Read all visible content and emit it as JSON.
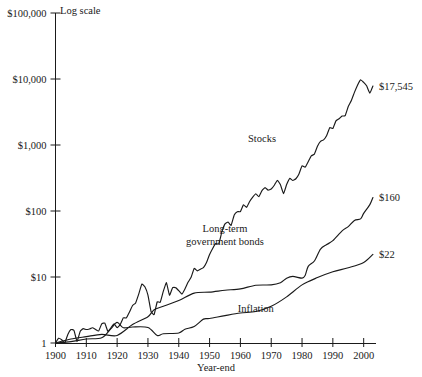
{
  "chart_data": {
    "type": "line",
    "title": "",
    "subtitle": "",
    "note": "Log scale",
    "xlabel": "Year-end",
    "ylabel": "",
    "log_y": true,
    "grid": false,
    "legend": "inline-annotations",
    "xlim": [
      1900,
      2004
    ],
    "ylim": [
      1,
      100000
    ],
    "x_ticks": [
      "1900",
      "1910",
      "1920",
      "1930",
      "1940",
      "1950",
      "1960",
      "1970",
      "1980",
      "1990",
      "2000"
    ],
    "y_ticks": [
      "$100,000",
      "$10,000",
      "$1,000",
      "$100",
      "$10",
      "1"
    ],
    "y_tick_values": [
      100000,
      10000,
      1000,
      100,
      10,
      1
    ],
    "series": [
      {
        "name": "Stocks",
        "end_label": "$17,545",
        "end_value": 17545,
        "x": [
          1900,
          1901,
          1902,
          1903,
          1904,
          1905,
          1906,
          1907,
          1908,
          1909,
          1910,
          1911,
          1912,
          1913,
          1914,
          1915,
          1916,
          1917,
          1918,
          1919,
          1920,
          1921,
          1922,
          1923,
          1924,
          1925,
          1926,
          1927,
          1928,
          1929,
          1930,
          1931,
          1932,
          1933,
          1934,
          1935,
          1936,
          1937,
          1938,
          1939,
          1940,
          1941,
          1942,
          1943,
          1944,
          1945,
          1946,
          1947,
          1948,
          1949,
          1950,
          1951,
          1952,
          1953,
          1954,
          1955,
          1956,
          1957,
          1958,
          1959,
          1960,
          1961,
          1962,
          1963,
          1964,
          1965,
          1966,
          1967,
          1968,
          1969,
          1970,
          1971,
          1972,
          1973,
          1974,
          1975,
          1976,
          1977,
          1978,
          1979,
          1980,
          1981,
          1982,
          1983,
          1984,
          1985,
          1986,
          1987,
          1988,
          1989,
          1990,
          1991,
          1992,
          1993,
          1994,
          1995,
          1996,
          1997,
          1998,
          1999,
          2000,
          2001,
          2002,
          2003
        ],
        "values": [
          1,
          1.18,
          1.12,
          1.0,
          1.35,
          1.6,
          1.55,
          1.05,
          1.5,
          1.65,
          1.6,
          1.63,
          1.7,
          1.6,
          1.52,
          1.95,
          2.0,
          1.5,
          1.7,
          1.95,
          1.7,
          1.9,
          2.4,
          2.4,
          2.95,
          3.7,
          4.05,
          5.5,
          7.8,
          7.1,
          5.3,
          3.0,
          2.7,
          4.2,
          4.15,
          6.1,
          8.2,
          5.3,
          6.9,
          6.9,
          6.2,
          5.5,
          6.6,
          8.3,
          9.9,
          13.5,
          12.4,
          13.1,
          13.9,
          16.6,
          21.9,
          27.1,
          32.1,
          31.8,
          48.6,
          63.9,
          68.1,
          60.8,
          87.2,
          97.6,
          98.1,
          124.5,
          113.6,
          139.5,
          162.5,
          182.8,
          164.3,
          203.5,
          225.9,
          206.8,
          215.1,
          245.9,
          292.5,
          249.6,
          183.4,
          251.6,
          311.7,
          289.3,
          308.2,
          365.1,
          483.6,
          459.9,
          558.6,
          684.6,
          727.6,
          958.5,
          1136,
          1195,
          1393,
          1834,
          1777,
          2318,
          2495,
          2745,
          2782,
          3827,
          4706,
          6276,
          8068,
          9766,
          8876,
          7822,
          6094,
          7840
        ],
        "annotation_x": 1967,
        "annotation_y": 1100
      },
      {
        "name": "Long-term government bonds",
        "end_label": "$160",
        "end_value": 160,
        "x": [
          1900,
          1905,
          1910,
          1915,
          1920,
          1925,
          1930,
          1932,
          1935,
          1940,
          1945,
          1950,
          1955,
          1960,
          1965,
          1970,
          1973,
          1975,
          1977,
          1980,
          1981,
          1982,
          1984,
          1986,
          1988,
          1990,
          1993,
          1995,
          1997,
          1999,
          2000,
          2002,
          2003
        ],
        "values": [
          1,
          1.15,
          1.25,
          1.35,
          1.3,
          1.9,
          2.5,
          3.2,
          3.6,
          4.4,
          5.7,
          5.9,
          6.3,
          6.6,
          7.5,
          7.6,
          8.2,
          9.6,
          10.2,
          9.6,
          10.5,
          14.5,
          17.5,
          26.5,
          31.0,
          35.5,
          50.0,
          58.0,
          72.0,
          76.0,
          92.0,
          125.0,
          160.0
        ],
        "annotation_x": 1955,
        "annotation_y": 48
      },
      {
        "name": "Inflation",
        "end_label": "$22",
        "end_value": 22,
        "x": [
          1900,
          1905,
          1910,
          1915,
          1918,
          1920,
          1922,
          1925,
          1930,
          1933,
          1935,
          1940,
          1942,
          1945,
          1948,
          1950,
          1955,
          1960,
          1965,
          1970,
          1975,
          1980,
          1985,
          1990,
          1995,
          2000,
          2003
        ],
        "values": [
          1,
          1.05,
          1.15,
          1.2,
          1.65,
          2.05,
          1.7,
          1.75,
          1.72,
          1.3,
          1.38,
          1.42,
          1.62,
          1.78,
          2.3,
          2.35,
          2.6,
          2.85,
          3.0,
          3.6,
          5.0,
          7.6,
          9.8,
          12.0,
          13.8,
          16.6,
          22.0
        ],
        "annotation_x": 1965,
        "annotation_y": 3.0
      }
    ]
  },
  "labels": {
    "log_scale": "Log scale",
    "year_end": "Year-end",
    "stocks": "Stocks",
    "bonds_line1": "Long-term",
    "bonds_line2": "government bonds",
    "inflation": "Inflation",
    "stocks_end": "$17,545",
    "bonds_end": "$160",
    "inflation_end": "$22",
    "y0": "$100,000",
    "y1": "$10,000",
    "y2": "$1,000",
    "y3": "$100",
    "y4": "$10",
    "y5": "1",
    "x0": "1900",
    "x1": "1910",
    "x2": "1920",
    "x3": "1930",
    "x4": "1940",
    "x5": "1950",
    "x6": "1960",
    "x7": "1970",
    "x8": "1980",
    "x9": "1990",
    "x10": "2000"
  },
  "colors": {
    "ink": "#1a1a1a",
    "background": "#ffffff"
  }
}
